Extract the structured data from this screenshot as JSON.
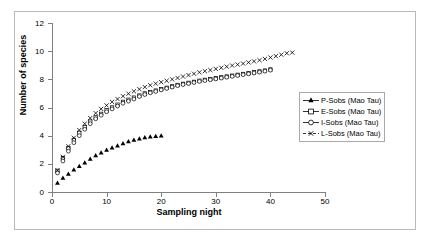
{
  "chart_data": {
    "type": "scatter",
    "title": "",
    "xlabel": "Sampling night",
    "ylabel": "Number of species",
    "xlim": [
      0,
      50
    ],
    "ylim": [
      0,
      12
    ],
    "xticks": [
      0,
      10,
      20,
      30,
      40,
      50
    ],
    "yticks": [
      0,
      2,
      4,
      6,
      8,
      10,
      12
    ],
    "grid": false,
    "legend_position": "right-middle",
    "series": [
      {
        "name": "P-Sobs (Mao Tau)",
        "marker": "filled-triangle",
        "x": [
          1,
          2,
          3,
          4,
          5,
          6,
          7,
          8,
          9,
          10,
          11,
          12,
          13,
          14,
          15,
          16,
          17,
          18,
          19,
          20
        ],
        "values": [
          0.65,
          1.0,
          1.3,
          1.6,
          1.85,
          2.1,
          2.35,
          2.6,
          2.8,
          3.0,
          3.15,
          3.3,
          3.45,
          3.6,
          3.7,
          3.8,
          3.88,
          3.93,
          3.97,
          4.0
        ]
      },
      {
        "name": "E-Sobs (Mao Tau)",
        "marker": "open-square",
        "x": [
          1,
          2,
          3,
          4,
          5,
          6,
          7,
          8,
          9,
          10,
          11,
          12,
          13,
          14,
          15,
          16,
          17,
          18,
          19,
          20,
          21,
          22,
          23,
          24,
          25,
          26,
          27,
          28,
          29,
          30,
          31,
          32,
          33,
          34,
          35,
          36,
          37,
          38,
          39,
          40
        ],
        "values": [
          1.5,
          2.4,
          3.1,
          3.7,
          4.2,
          4.6,
          5.0,
          5.3,
          5.55,
          5.8,
          6.0,
          6.2,
          6.4,
          6.55,
          6.7,
          6.85,
          7.0,
          7.1,
          7.2,
          7.3,
          7.4,
          7.5,
          7.6,
          7.68,
          7.75,
          7.82,
          7.9,
          7.96,
          8.02,
          8.08,
          8.14,
          8.2,
          8.26,
          8.32,
          8.38,
          8.44,
          8.5,
          8.56,
          8.62,
          8.7
        ]
      },
      {
        "name": "I-Sobs (Mao Tau)",
        "marker": "open-circle",
        "x": [
          1,
          2,
          3,
          4,
          5,
          6,
          7,
          8,
          9,
          10,
          11,
          12,
          13,
          14,
          15,
          16,
          17,
          18,
          19,
          20,
          21,
          22,
          23,
          24,
          25,
          26,
          27,
          28,
          29,
          30,
          31,
          32,
          33,
          34,
          35,
          36,
          37,
          38,
          39,
          40
        ],
        "values": [
          1.35,
          2.2,
          2.9,
          3.5,
          4.0,
          4.45,
          4.85,
          5.2,
          5.45,
          5.7,
          5.9,
          6.1,
          6.3,
          6.45,
          6.6,
          6.78,
          6.92,
          7.04,
          7.14,
          7.25,
          7.35,
          7.45,
          7.55,
          7.63,
          7.7,
          7.77,
          7.85,
          7.91,
          7.97,
          8.03,
          8.09,
          8.15,
          8.21,
          8.27,
          8.33,
          8.39,
          8.45,
          8.51,
          8.58,
          8.65
        ]
      },
      {
        "name": "L-Sobs (Mao Tau)",
        "marker": "cross-x",
        "x": [
          1,
          2,
          3,
          4,
          5,
          6,
          7,
          8,
          9,
          10,
          11,
          12,
          13,
          14,
          15,
          16,
          17,
          18,
          19,
          20,
          21,
          22,
          23,
          24,
          25,
          26,
          27,
          28,
          29,
          30,
          31,
          32,
          33,
          34,
          35,
          36,
          37,
          38,
          39,
          40,
          41,
          42,
          43,
          44
        ],
        "values": [
          1.55,
          2.5,
          3.25,
          3.85,
          4.4,
          4.85,
          5.25,
          5.6,
          5.9,
          6.15,
          6.4,
          6.6,
          6.8,
          6.98,
          7.15,
          7.3,
          7.45,
          7.58,
          7.7,
          7.8,
          7.9,
          8.0,
          8.1,
          8.2,
          8.3,
          8.4,
          8.5,
          8.58,
          8.66,
          8.74,
          8.82,
          8.9,
          8.98,
          9.05,
          9.12,
          9.2,
          9.28,
          9.36,
          9.45,
          9.55,
          9.65,
          9.75,
          9.85,
          9.9
        ]
      }
    ]
  },
  "legend": {
    "items": [
      {
        "label": "P-Sobs (Mao Tau)"
      },
      {
        "label": "E-Sobs (Mao Tau)"
      },
      {
        "label": "I-Sobs (Mao Tau)"
      },
      {
        "label": "L-Sobs (Mao Tau)"
      }
    ]
  },
  "axes": {
    "y_title": "Number of species",
    "x_title": "Sampling night",
    "y_tick_labels": [
      "0",
      "2",
      "4",
      "6",
      "8",
      "10",
      "12"
    ],
    "x_tick_labels": [
      "0",
      "10",
      "20",
      "30",
      "40",
      "50"
    ]
  },
  "colors": {
    "frame": "#b9b9b9",
    "axis": "#808080",
    "marker": "#000000",
    "background": "#ffffff"
  }
}
